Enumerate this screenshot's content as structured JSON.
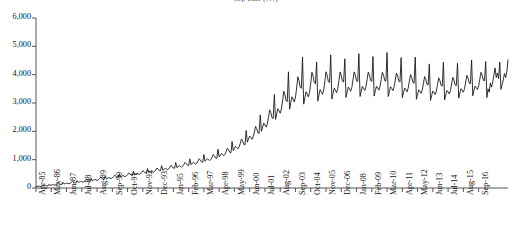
{
  "chart_data": {
    "type": "line",
    "title": "Sep-Late (???)",
    "xlabel": "",
    "ylabel": "",
    "ylim": [
      0,
      6000
    ],
    "grid": false,
    "legend": "none",
    "line_color": "#1a1a1a",
    "background": "#ffffff",
    "y_ticks": [
      "0",
      "1,000",
      "2,000",
      "3,000",
      "4,000",
      "5,000",
      "6,000"
    ],
    "y_tick_values": [
      0,
      1000,
      2000,
      3000,
      4000,
      5000,
      6000
    ],
    "x_tick_labels": [
      "Apr-85",
      "May-86",
      "Jun-87",
      "Jul-88",
      "Aug-89",
      "Sep-90",
      "Oct-91",
      "Nov-92",
      "Dec-93",
      "Jan-95",
      "Feb-96",
      "Mar-97",
      "Apr-98",
      "May-99",
      "Jun-00",
      "Jul-01",
      "Aug-02",
      "Sep-03",
      "Oct-04",
      "Nov-05",
      "Dec-06",
      "Jan-08",
      "Feb-09",
      "Mar-10",
      "Apr-11",
      "May-12",
      "Jun-13",
      "Jul-14",
      "Aug-15",
      "Sep-16"
    ],
    "x_tick_interval_months": 13,
    "x_start": "Apr-85",
    "x_end": "Sep-16",
    "series_name": "monthly value",
    "values": [
      40,
      55,
      70,
      60,
      50,
      65,
      85,
      110,
      95,
      75,
      70,
      130,
      90,
      105,
      120,
      110,
      100,
      115,
      140,
      170,
      150,
      125,
      118,
      195,
      140,
      158,
      175,
      162,
      150,
      168,
      198,
      235,
      210,
      180,
      172,
      262,
      196,
      215,
      235,
      220,
      208,
      228,
      262,
      305,
      278,
      244,
      236,
      338,
      256,
      278,
      300,
      284,
      270,
      292,
      330,
      378,
      348,
      312,
      302,
      418,
      320,
      344,
      368,
      350,
      334,
      358,
      400,
      452,
      420,
      380,
      370,
      500,
      388,
      414,
      440,
      420,
      402,
      428,
      474,
      530,
      496,
      452,
      442,
      590,
      462,
      490,
      518,
      496,
      476,
      504,
      554,
      614,
      578,
      530,
      520,
      686,
      542,
      572,
      602,
      578,
      556,
      586,
      640,
      704,
      666,
      614,
      604,
      790,
      628,
      660,
      692,
      666,
      642,
      674,
      732,
      800,
      760,
      704,
      692,
      902,
      720,
      756,
      790,
      762,
      736,
      770,
      832,
      906,
      864,
      804,
      792,
      1030,
      824,
      864,
      902,
      872,
      844,
      882,
      950,
      1032,
      986,
      920,
      908,
      1180,
      944,
      990,
      1034,
      1000,
      968,
      1012,
      1090,
      1184,
      1134,
      1060,
      1046,
      1370,
      1100,
      1160,
      1216,
      1176,
      1138,
      1192,
      1290,
      1408,
      1348,
      1256,
      1240,
      1640,
      1320,
      1400,
      1474,
      1428,
      1382,
      1450,
      1576,
      1726,
      1656,
      1542,
      1522,
      2030,
      1620,
      1730,
      1830,
      1776,
      1718,
      1806,
      1974,
      2174,
      2090,
      1948,
      1924,
      2580,
      2000,
      2150,
      2288,
      2222,
      2150,
      2266,
      2490,
      2758,
      2656,
      2480,
      2450,
      3300,
      2420,
      2620,
      2800,
      2724,
      2636,
      2784,
      3068,
      3414,
      3296,
      3084,
      3048,
      4100,
      2780,
      3010,
      3218,
      3134,
      3036,
      3206,
      3530,
      3926,
      3794,
      3556,
      3516,
      4620,
      2960,
      3190,
      3396,
      3312,
      3214,
      3382,
      3702,
      4086,
      3952,
      3718,
      3680,
      4450,
      3066,
      3282,
      3474,
      3396,
      3304,
      3460,
      3756,
      4102,
      3974,
      3754,
      3720,
      4700,
      3140,
      3344,
      3524,
      3452,
      3366,
      3512,
      3786,
      4096,
      3976,
      3770,
      3740,
      4560,
      3196,
      3392,
      3564,
      3496,
      3414,
      3554,
      3814,
      4098,
      3984,
      3786,
      3758,
      4740,
      3230,
      3420,
      3586,
      3520,
      3442,
      3578,
      3828,
      4094,
      3984,
      3792,
      3766,
      4640,
      3244,
      3430,
      3592,
      3528,
      3452,
      3586,
      3830,
      4084,
      3978,
      3790,
      3766,
      4780,
      3230,
      3414,
      3574,
      3512,
      3438,
      3570,
      3810,
      4056,
      3952,
      3768,
      3744,
      4600,
      3190,
      3372,
      3530,
      3470,
      3398,
      3528,
      3764,
      4004,
      3902,
      3722,
      3700,
      4620,
      3130,
      3310,
      3466,
      3408,
      3338,
      3466,
      3698,
      3932,
      3832,
      3656,
      3636,
      4380,
      3092,
      3270,
      3424,
      3368,
      3300,
      3426,
      3656,
      3886,
      3788,
      3616,
      3598,
      4440,
      3110,
      3288,
      3442,
      3386,
      3318,
      3444,
      3674,
      3904,
      3806,
      3634,
      3616,
      4400,
      3170,
      3350,
      3506,
      3450,
      3382,
      3510,
      3742,
      3976,
      3876,
      3702,
      3682,
      4520,
      3256,
      3440,
      3600,
      3544,
      3476,
      3606,
      3844,
      4084,
      3982,
      3804,
      3784,
      4460,
      3190,
      3500,
      3380,
      3700,
      3560,
      3760,
      3980,
      4240,
      3900,
      4060,
      3860,
      4440,
      3480,
      3660,
      3820,
      4040,
      3900,
      4100,
      4520
    ]
  }
}
